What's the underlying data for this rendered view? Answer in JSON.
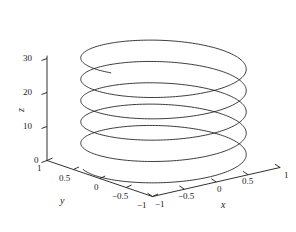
{
  "chart_data": {
    "type": "line",
    "subtype": "parametric-3d-helix",
    "title": "",
    "xlabel": "x",
    "ylabel": "y",
    "zlabel": "z",
    "xlim": [
      -1,
      1
    ],
    "ylim": [
      -1,
      1
    ],
    "zlim": [
      0,
      32
    ],
    "grid": false,
    "legend": null,
    "projection": "3d",
    "series": [
      {
        "name": "helix",
        "parametric": "x = cos(t), y = sin(t), z = t",
        "t_range": [
          0,
          32
        ],
        "turns": 5.1,
        "color": "#1a1a1a",
        "linewidth": 0.8
      }
    ],
    "axes": {
      "z": {
        "ticks": [
          0,
          10,
          20,
          30
        ],
        "tick_labels": [
          "0",
          "10",
          "20",
          "30"
        ]
      },
      "y": {
        "ticks": [
          1,
          0.5,
          0,
          -0.5,
          -1
        ],
        "tick_labels": [
          "1",
          "0.5",
          "0",
          "-0.5",
          "-1"
        ]
      },
      "x": {
        "ticks": [
          -1,
          -0.5,
          0,
          0.5,
          1
        ],
        "tick_labels": [
          "-1",
          "-0.5",
          "0",
          "0.5",
          "1"
        ]
      }
    }
  },
  "zAxis": {
    "title": "z",
    "labels": {
      "t30": "30",
      "t20": "20",
      "t10": "10",
      "t0": "0"
    }
  },
  "yAxis": {
    "title": "y",
    "labels": {
      "t1": "1",
      "t05": "0.5",
      "t0": "0",
      "tm05": "−0.5",
      "tm1": "−1"
    }
  },
  "xAxis": {
    "title": "x",
    "labels": {
      "tm1": "−1",
      "tm05": "−0.5",
      "t0": "0",
      "t05": "0.5",
      "t1": "1"
    }
  }
}
